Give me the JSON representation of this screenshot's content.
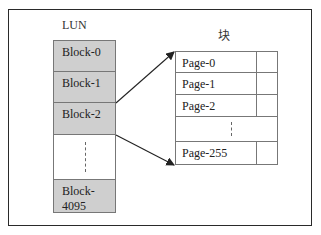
{
  "diagram": {
    "lun": {
      "title": "LUN",
      "blocks": [
        {
          "label": "Block-0"
        },
        {
          "label": "Block-1"
        },
        {
          "label": "Block-2"
        },
        {
          "label": "",
          "ellipsis": true
        },
        {
          "label": "Block-4095"
        }
      ]
    },
    "block": {
      "title": "块",
      "pages": [
        {
          "label": "Page-0"
        },
        {
          "label": "Page-1"
        },
        {
          "label": "Page-2"
        },
        {
          "label": "",
          "ellipsis": true
        },
        {
          "label": "Page-255"
        }
      ]
    },
    "arrows": [
      {
        "from": "Block-2 top-right",
        "to": "Page-0 top-left"
      },
      {
        "from": "Block-2 bottom-right",
        "to": "Page-255 bottom-left"
      }
    ],
    "colors": {
      "block_fill": "#cfcfcf",
      "border": "#777777",
      "frame": "#2a2a2a"
    }
  }
}
